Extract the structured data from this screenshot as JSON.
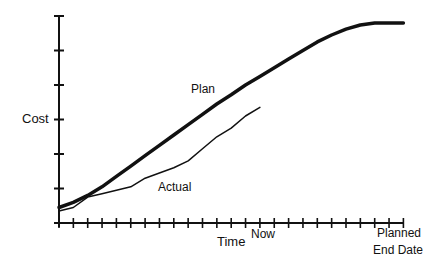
{
  "chart_data": {
    "type": "line",
    "title": "",
    "xlabel": "Time",
    "ylabel": "Cost",
    "grid": false,
    "legend": "inline labels",
    "x_ticks": 25,
    "y_ticks": 7,
    "x_markers": [
      {
        "label": "Now",
        "tick_index": 14
      },
      {
        "label": "Planned\nEnd Date",
        "tick_index": 23
      }
    ],
    "xlim": [
      0,
      24
    ],
    "ylim": [
      0,
      6
    ],
    "series": [
      {
        "name": "Plan",
        "style": "thick",
        "x": [
          0,
          1,
          2,
          3,
          4,
          5,
          6,
          7,
          8,
          9,
          10,
          11,
          12,
          13,
          14,
          15,
          16,
          17,
          18,
          19,
          20,
          21,
          22,
          23,
          24
        ],
        "y": [
          0.45,
          0.6,
          0.8,
          1.05,
          1.35,
          1.65,
          1.95,
          2.25,
          2.55,
          2.85,
          3.15,
          3.45,
          3.72,
          4.0,
          4.25,
          4.5,
          4.75,
          5.0,
          5.25,
          5.45,
          5.62,
          5.74,
          5.8,
          5.8,
          5.8
        ]
      },
      {
        "name": "Actual",
        "style": "thin",
        "x": [
          0,
          1,
          2,
          3,
          4,
          5,
          6,
          7,
          8,
          9,
          10,
          11,
          12,
          13,
          14
        ],
        "y": [
          0.35,
          0.45,
          0.75,
          0.85,
          0.95,
          1.05,
          1.3,
          1.45,
          1.6,
          1.8,
          2.15,
          2.5,
          2.75,
          3.1,
          3.35
        ]
      }
    ]
  },
  "labels": {
    "y_axis": "Cost",
    "x_axis": "Time",
    "now": "Now",
    "planned_line1": "Planned",
    "planned_line2": "End Date",
    "plan": "Plan",
    "actual": "Actual"
  }
}
